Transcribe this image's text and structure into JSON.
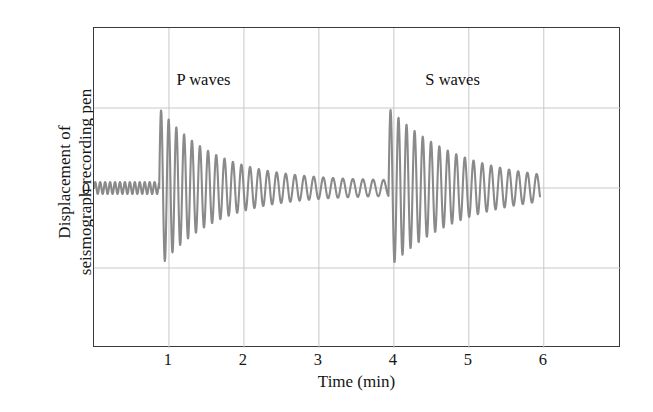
{
  "chart_data": {
    "type": "line",
    "title": "",
    "xlabel": "Time (min)",
    "ylabel": "Displacement of\nseismograph recording pen",
    "xlim": [
      0,
      7.03
    ],
    "ylim": [
      -2,
      2
    ],
    "xticks": [
      1,
      2,
      3,
      4,
      5,
      6
    ],
    "xtick_labels": [
      "1",
      "2",
      "3",
      "4",
      "5",
      "6"
    ],
    "yticks": [
      0
    ],
    "ytick_labels": [
      "0"
    ],
    "grid": true,
    "grid_horizontal_values": [
      1,
      0,
      -1
    ],
    "legend": "none",
    "trace_color": "#8a8a8a",
    "frame_color": "#3a3a3a",
    "grid_color": "#c8c8c8",
    "annotations": [
      {
        "text": "P waves",
        "x": 1.1,
        "y": 1.35
      },
      {
        "text": "S waves",
        "x": 4.42,
        "y": 1.35
      }
    ],
    "series": [
      {
        "name": "seismogram",
        "description": "Seismograph trace: low background noise, P-wave arrival at t=1 min, decaying coda, S-wave arrival at t=4 min, decaying to end at t=5.95 min",
        "segments": [
          {
            "name": "background-noise",
            "t_start": 0.0,
            "t_end": 0.87,
            "period": 0.066,
            "amplitude": 0.075,
            "decay": 0.0
          },
          {
            "name": "p-wave",
            "t_start": 0.87,
            "t_end": 3.93,
            "onset_amplitude": 1.0,
            "end_amplitude": 0.1,
            "period_start": 0.1,
            "period_end": 0.14,
            "decay_constant": 1.35
          },
          {
            "name": "s-wave",
            "t_start": 3.93,
            "t_end": 5.95,
            "onset_amplitude": 1.0,
            "end_amplitude": 0.17,
            "period_start": 0.105,
            "period_end": 0.125,
            "decay_constant": 1.05
          }
        ],
        "p_arrival_time": 1.0,
        "s_arrival_time": 4.0,
        "s_minus_p_interval": 3.0,
        "max_positive_amplitude": 1.0,
        "max_negative_amplitude": -1.0
      }
    ]
  },
  "axis": {
    "xlabel": "Time (min)",
    "ylabel_line1": "Displacement of",
    "ylabel_line2": "seismograph recording pen",
    "zero_label": "0",
    "xtick_labels": [
      "1",
      "2",
      "3",
      "4",
      "5",
      "6"
    ]
  },
  "annotations": {
    "p_waves": "P waves",
    "s_waves": "S waves"
  }
}
